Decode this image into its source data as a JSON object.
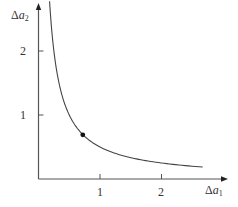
{
  "chart_data": {
    "type": "line",
    "title": "",
    "xlabel": "Δa1",
    "ylabel": "Δa2",
    "xlabel_parts": {
      "symbol": "Δ",
      "var": "a",
      "sub": "1"
    },
    "ylabel_parts": {
      "symbol": "Δ",
      "var": "a",
      "sub": "2"
    },
    "xlim": [
      0,
      3.05
    ],
    "ylim": [
      0,
      2.72
    ],
    "x_ticks": [
      1,
      2
    ],
    "y_ticks": [
      1,
      2
    ],
    "x_tick_labels": [
      "1",
      "2"
    ],
    "y_tick_labels": [
      "1",
      "2"
    ],
    "grid": false,
    "legend": null,
    "series": [
      {
        "name": "curve Δa1·Δa2 = 0.5",
        "function": "y = 0.5 / x",
        "x_range": [
          0.18,
          2.67
        ],
        "x": [
          0.18,
          0.2,
          0.25,
          0.3,
          0.4,
          0.5,
          0.6,
          0.75,
          1.0,
          1.25,
          1.5,
          1.75,
          2.0,
          2.25,
          2.5,
          2.67
        ],
        "values": [
          2.78,
          2.5,
          2.0,
          1.67,
          1.25,
          1.0,
          0.83,
          0.67,
          0.5,
          0.4,
          0.33,
          0.29,
          0.25,
          0.22,
          0.2,
          0.19
        ]
      }
    ],
    "points": [
      {
        "name": "marked point",
        "x": 0.72,
        "y": 0.69
      }
    ],
    "colors": {
      "axis": "#555555",
      "curve": "#444444",
      "point": "#111111"
    }
  },
  "labels": {
    "x_tick_1": "1",
    "x_tick_2": "2",
    "y_tick_1": "1",
    "y_tick_2": "2",
    "x_axis_symbol": "Δ",
    "x_axis_var": "a",
    "x_axis_sub": "1",
    "y_axis_symbol": "Δ",
    "y_axis_var": "a",
    "y_axis_sub": "2"
  }
}
